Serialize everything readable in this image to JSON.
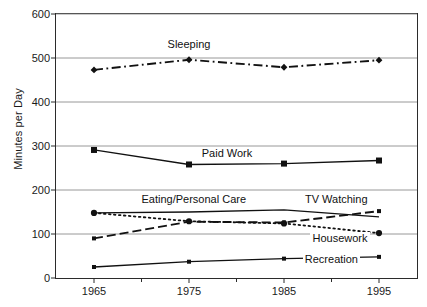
{
  "chart_data": {
    "type": "line",
    "title": "",
    "xlabel": "",
    "ylabel": "Minutes per Day",
    "x": [
      1965,
      1975,
      1985,
      1995
    ],
    "categories": [
      "1965",
      "1975",
      "1985",
      "1995"
    ],
    "xlim": [
      1961,
      1999
    ],
    "ylim": [
      0,
      600
    ],
    "ytick_labels": [
      "0",
      "100",
      "200",
      "300",
      "400",
      "500",
      "600"
    ],
    "ytick_values": [
      0,
      100,
      200,
      300,
      400,
      500,
      600
    ],
    "xtick_labels": [
      "1965",
      "1975",
      "1985",
      "1995"
    ],
    "grid": "horizontal",
    "legend_position": "inline-labels",
    "series": [
      {
        "name": "Sleeping",
        "label": "Sleeping",
        "style": "dash-dot",
        "marker": "diamond",
        "color": "#111111",
        "values": [
          473,
          496,
          479,
          495
        ]
      },
      {
        "name": "Paid Work",
        "label": "Paid Work",
        "style": "solid",
        "marker": "square",
        "color": "#111111",
        "values": [
          291,
          258,
          260,
          267
        ]
      },
      {
        "name": "Eating/Personal Care",
        "label": "Eating/Personal Care",
        "style": "solid",
        "marker": "none",
        "color": "#111111",
        "values": [
          148,
          150,
          155,
          139
        ]
      },
      {
        "name": "TV Watching",
        "label": "TV Watching",
        "style": "dashed",
        "marker": "small-square",
        "color": "#111111",
        "values": [
          90,
          128,
          126,
          152
        ]
      },
      {
        "name": "Housework",
        "label": "Housework",
        "style": "dotted",
        "marker": "circle",
        "color": "#111111",
        "values": [
          148,
          129,
          124,
          102
        ]
      },
      {
        "name": "Recreation",
        "label": "Recreation",
        "style": "solid",
        "marker": "small-square",
        "color": "#111111",
        "values": [
          25,
          37,
          44,
          48
        ]
      }
    ],
    "annotations": [
      {
        "text": "Sleeping",
        "x": 1975,
        "y": 530
      },
      {
        "text": "Paid Work",
        "x": 1979,
        "y": 281
      },
      {
        "text": "Eating/Personal Care",
        "x": 1975.5,
        "y": 178
      },
      {
        "text": "TV Watching",
        "x": 1994,
        "y": 178
      },
      {
        "text": "Housework",
        "x": 1994,
        "y": 88
      },
      {
        "text": "Recreation",
        "x": 1993,
        "y": 40
      }
    ]
  }
}
